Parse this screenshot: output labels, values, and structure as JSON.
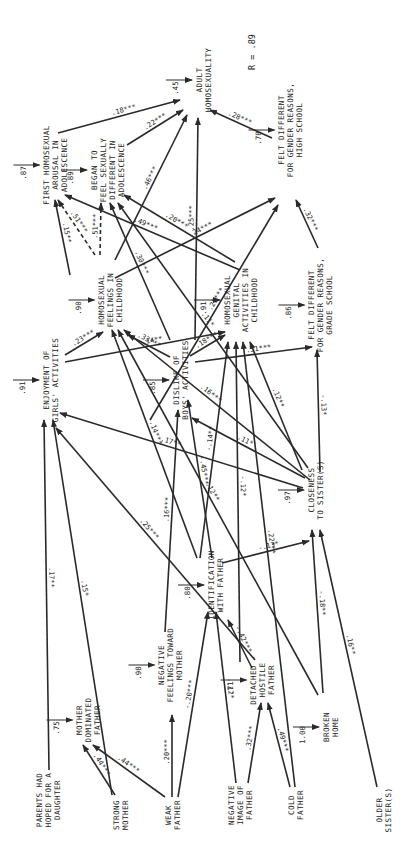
{
  "diagram": {
    "orientation": "rotated-90-ccw",
    "r_label": "R = .89",
    "nodes": [
      {
        "id": "parents_hoped_daughter",
        "lines": [
          "PARENTS HAD",
          "HOPED FOR A",
          "DAUGHTER"
        ],
        "x": 48,
        "y": 800,
        "residual": null
      },
      {
        "id": "strong_mother",
        "lines": [
          "STRONG",
          "MOTHER"
        ],
        "x": 120,
        "y": 815,
        "residual": null
      },
      {
        "id": "weak_father",
        "lines": [
          "WEAK",
          "FATHER"
        ],
        "x": 172,
        "y": 815,
        "residual": null
      },
      {
        "id": "negative_image_father",
        "lines": [
          "NEGATIVE",
          "IMAGE OF",
          "FATHER"
        ],
        "x": 240,
        "y": 805,
        "residual": null
      },
      {
        "id": "cold_father",
        "lines": [
          "COLD",
          "FATHER"
        ],
        "x": 295,
        "y": 805,
        "residual": null
      },
      {
        "id": "older_sisters",
        "lines": [
          "OLDER",
          "SISTER(S)"
        ],
        "x": 383,
        "y": 810,
        "residual": null
      },
      {
        "id": "mother_dominated_father",
        "lines": [
          "MOTHER",
          "DOMINATED",
          "FATHER"
        ],
        "x": 88,
        "y": 720,
        "residual": ".75"
      },
      {
        "id": "negative_feelings_mother",
        "lines": [
          "NEGATIVE",
          "FEELINGS TOWARD",
          "MOTHER"
        ],
        "x": 170,
        "y": 665,
        "residual": ".98"
      },
      {
        "id": "detached_hostile_father",
        "lines": [
          "DETACHED -",
          "HOSTILE",
          "FATHER"
        ],
        "x": 262,
        "y": 680,
        "residual": ".71"
      },
      {
        "id": "broken_home",
        "lines": [
          "BROKEN",
          "HOME"
        ],
        "x": 330,
        "y": 727,
        "residual": "1.00"
      },
      {
        "id": "identification_father",
        "lines": [
          "IDENTIFICATION",
          "WITH FATHER"
        ],
        "x": 215,
        "y": 585,
        "residual": ".80"
      },
      {
        "id": "closeness_sisters",
        "lines": [
          "CLOSENESS",
          "TO SISTER(S)"
        ],
        "x": 315,
        "y": 490,
        "residual": ".97"
      },
      {
        "id": "enjoyment_girls_activities",
        "lines": [
          "ENJOYMENT OF",
          "GIRLS' ACTIVITIES"
        ],
        "x": 50,
        "y": 380,
        "residual": ".91"
      },
      {
        "id": "dislike_boys_activities",
        "lines": [
          "DISLIKE OF",
          "BOYS' ACTIVITIES"
        ],
        "x": 180,
        "y": 380,
        "residual": ".85"
      },
      {
        "id": "homosexual_feelings_childhood",
        "lines": [
          "HOMOSEXUAL",
          "FEELINGS IN",
          "CHILDHOOD"
        ],
        "x": 110,
        "y": 300,
        "residual": ".90"
      },
      {
        "id": "homosexual_genital_activities_childhood",
        "lines": [
          "HOMOSEXUAL",
          "GENITAL",
          "ACTIVITIES IN",
          "CHILDHOOD"
        ],
        "x": 240,
        "y": 300,
        "residual": ".91"
      },
      {
        "id": "felt_different_grade_school",
        "lines": [
          "FELT DIFFERENT",
          "FOR GENDER REASONS,",
          "GRADE SCHOOL"
        ],
        "x": 320,
        "y": 305,
        "residual": ".86"
      },
      {
        "id": "first_homosexual_arousal",
        "lines": [
          "FIRST HOMOSEXUAL",
          "AROUSAL IN",
          "ADOLESCENCE"
        ],
        "x": 55,
        "y": 165,
        "residual": ".87"
      },
      {
        "id": "began_feel_sexually_different",
        "lines": [
          "BEGAN TO",
          "FEEL SEXUALLY",
          "DIFFERENT IN",
          "ADOLESCENCE"
        ],
        "x": 107,
        "y": 170,
        "residual": ".89"
      },
      {
        "id": "felt_different_high_school",
        "lines": [
          "FELT DIFFERENT",
          "FOR GENDER REASONS,",
          "HIGH SCHOOL"
        ],
        "x": 290,
        "y": 130,
        "residual": ".78"
      },
      {
        "id": "adult_homosexuality",
        "lines": [
          "ADULT",
          "HOMOSEXUALITY"
        ],
        "x": 203,
        "y": 80,
        "residual": ".45"
      }
    ],
    "edges": [
      {
        "from": "strong_mother",
        "to": "mother_dominated_father",
        "coef": ".44***",
        "x1": 115,
        "y1": 795,
        "x2": 83,
        "y2": 745
      },
      {
        "from": "weak_father",
        "to": "mother_dominated_father",
        "coef": ".44***",
        "x1": 165,
        "y1": 797,
        "x2": 93,
        "y2": 745
      },
      {
        "from": "weak_father",
        "to": "negative_feelings_mother",
        "coef": ".20***",
        "x1": 172,
        "y1": 797,
        "x2": 172,
        "y2": 715
      },
      {
        "from": "weak_father",
        "to": "identification_father",
        "coef": "-.20***",
        "x1": 178,
        "y1": 797,
        "x2": 208,
        "y2": 612
      },
      {
        "from": "negative_image_father",
        "to": "identification_father",
        "coef": "-.12*",
        "x1": 236,
        "y1": 783,
        "x2": 216,
        "y2": 612
      },
      {
        "from": "negative_image_father",
        "to": "detached_hostile_father",
        "coef": ".32***",
        "x1": 248,
        "y1": 783,
        "x2": 261,
        "y2": 703
      },
      {
        "from": "cold_father",
        "to": "detached_hostile_father",
        "coef": ".49***",
        "x1": 290,
        "y1": 787,
        "x2": 268,
        "y2": 703
      },
      {
        "from": "detached_hostile_father",
        "to": "identification_father",
        "coef": "-.42***",
        "x1": 252,
        "y1": 668,
        "x2": 228,
        "y2": 620
      },
      {
        "from": "identification_father",
        "to": "closeness_sisters",
        "coef": "-.13*",
        "x1": 222,
        "y1": 563,
        "x2": 309,
        "y2": 541
      },
      {
        "from": "broken_home",
        "to": "closeness_sisters",
        "coef": "-.18**",
        "x1": 323,
        "y1": 693,
        "x2": 312,
        "y2": 530
      },
      {
        "from": "older_sisters",
        "to": "closeness_sisters",
        "coef": ".16**",
        "x1": 377,
        "y1": 787,
        "x2": 320,
        "y2": 530
      },
      {
        "from": "identification_father",
        "to": "dislike_boys_activities",
        "coef": "-.45***",
        "x1": 212,
        "y1": 558,
        "x2": 188,
        "y2": 400
      },
      {
        "from": "parents_hoped_daughter",
        "to": "enjoyment_girls_activities",
        "coef": ".17**",
        "x1": 49,
        "y1": 770,
        "x2": 44,
        "y2": 420
      },
      {
        "from": "strong_mother",
        "to": "enjoyment_girls_activities",
        "coef": ".15*",
        "x1": 112,
        "y1": 795,
        "x2": 53,
        "y2": 420
      },
      {
        "from": "closeness_sisters",
        "to": "enjoyment_girls_activities",
        "coef": ".17**",
        "x1": 303,
        "y1": 488,
        "x2": 60,
        "y2": 413
      },
      {
        "from": "detached_hostile_father",
        "to": "enjoyment_girls_activities",
        "coef": ".25***",
        "x1": 255,
        "y1": 660,
        "x2": 56,
        "y2": 428
      },
      {
        "from": "negative_feelings_mother",
        "to": "dislike_boys_activities",
        "coef": ".16***",
        "x1": 165,
        "y1": 632,
        "x2": 178,
        "y2": 410
      },
      {
        "from": "closeness_sisters",
        "to": "dislike_boys_activities",
        "coef": ".11*",
        "x1": 305,
        "y1": 478,
        "x2": 192,
        "y2": 418
      },
      {
        "from": "enjoyment_girls_activities",
        "to": "homosexual_feelings_childhood",
        "coef": ".23***",
        "x1": 65,
        "y1": 355,
        "x2": 103,
        "y2": 332
      },
      {
        "from": "enjoyment_girls_activities",
        "to": "homosexual_genital_activities_childhood",
        "coef": ".14**",
        "x1": 65,
        "y1": 362,
        "x2": 225,
        "y2": 332
      },
      {
        "from": "dislike_boys_activities",
        "to": "homosexual_feelings_childhood",
        "coef": ".33***",
        "x1": 170,
        "y1": 357,
        "x2": 128,
        "y2": 335
      },
      {
        "from": "dislike_boys_activities",
        "to": "homosexual_genital_activities_childhood",
        "coef": ".18***",
        "x1": 190,
        "y1": 356,
        "x2": 225,
        "y2": 335
      },
      {
        "from": "dislike_boys_activities",
        "to": "felt_different_grade_school",
        "coef": ".51***",
        "x1": 195,
        "y1": 362,
        "x2": 312,
        "y2": 347
      },
      {
        "from": "identification_father",
        "to": "homosexual_feelings_childhood",
        "coef": "-.14***",
        "x1": 197,
        "y1": 558,
        "x2": 112,
        "y2": 330
      },
      {
        "from": "broken_home",
        "to": "homosexual_feelings_childhood",
        "coef": ".12**",
        "x1": 318,
        "y1": 695,
        "x2": 118,
        "y2": 330
      },
      {
        "from": "closeness_sisters",
        "to": "homosexual_feelings_childhood",
        "coef": ".16***",
        "x1": 310,
        "y1": 480,
        "x2": 124,
        "y2": 330
      },
      {
        "from": "identification_father",
        "to": "homosexual_genital_activities_childhood",
        "coef": "-.14**",
        "x1": 200,
        "y1": 558,
        "x2": 228,
        "y2": 342
      },
      {
        "from": "detached_hostile_father",
        "to": "homosexual_genital_activities_childhood",
        "coef": "-.12*",
        "x1": 240,
        "y1": 662,
        "x2": 236,
        "y2": 342
      },
      {
        "from": "cold_father",
        "to": "homosexual_genital_activities_childhood",
        "coef": ".22***",
        "x1": 295,
        "y1": 787,
        "x2": 243,
        "y2": 342
      },
      {
        "from": "closeness_sisters",
        "to": "homosexual_genital_activities_childhood",
        "coef": ".12**",
        "x1": 302,
        "y1": 470,
        "x2": 250,
        "y2": 342
      },
      {
        "from": "closeness_sisters",
        "to": "felt_different_grade_school",
        "coef": "-.13*",
        "x1": 320,
        "y1": 472,
        "x2": 317,
        "y2": 350
      },
      {
        "from": "homosexual_feelings_childhood",
        "to": "first_homosexual_arousal",
        "coef": ".15**",
        "x1": 70,
        "y1": 275,
        "x2": 55,
        "y2": 200
      },
      {
        "from": "homosexual_feelings_childhood",
        "to": "first_homosexual_arousal",
        "coef": ".51***",
        "dashed": true,
        "x1": 95,
        "y1": 255,
        "x2": 58,
        "y2": 200
      },
      {
        "from": "homosexual_feelings_childhood",
        "to": "began_feel_sexually_different",
        "coef": ".51***",
        "dashed": true,
        "x1": 100,
        "y1": 255,
        "x2": 101,
        "y2": 203
      },
      {
        "from": "homosexual_feelings_childhood",
        "to": "felt_different_high_school",
        "coef": ".24***",
        "x1": 115,
        "y1": 278,
        "x2": 275,
        "y2": 198
      },
      {
        "from": "dislike_boys_activities",
        "to": "began_feel_sexually_different",
        "coef": ".30***",
        "x1": 170,
        "y1": 340,
        "x2": 110,
        "y2": 203
      },
      {
        "from": "closeness_sisters",
        "to": "began_feel_sexually_different",
        "coef": ".11*",
        "x1": 308,
        "y1": 468,
        "x2": 118,
        "y2": 203
      },
      {
        "from": "homosexual_genital_activities_childhood",
        "to": "began_feel_sexually_different",
        "coef": ".20***",
        "x1": 235,
        "y1": 262,
        "x2": 124,
        "y2": 195
      },
      {
        "from": "homosexual_genital_activities_childhood",
        "to": "first_homosexual_arousal",
        "coef": ".49***",
        "x1": 240,
        "y1": 270,
        "x2": 65,
        "y2": 195
      },
      {
        "from": "felt_different_grade_school",
        "to": "felt_different_high_school",
        "coef": ".32***",
        "x1": 318,
        "y1": 248,
        "x2": 296,
        "y2": 200
      },
      {
        "from": "enjoyment_girls_activities",
        "to": "felt_different_high_school",
        "coef": ".25***",
        "x1": 150,
        "y1": 420,
        "x2": 278,
        "y2": 205
      },
      {
        "from": "first_homosexual_arousal",
        "to": "adult_homosexuality",
        "coef": ".18***",
        "x1": 58,
        "y1": 133,
        "x2": 180,
        "y2": 100
      },
      {
        "from": "began_feel_sexually_different",
        "to": "adult_homosexuality",
        "coef": ".22***",
        "x1": 127,
        "y1": 145,
        "x2": 183,
        "y2": 110
      },
      {
        "from": "homosexual_feelings_childhood",
        "to": "adult_homosexuality",
        "coef": ".46***",
        "x1": 115,
        "y1": 260,
        "x2": 187,
        "y2": 115
      },
      {
        "from": "dislike_boys_activities",
        "to": "adult_homosexuality",
        "coef": ".25***",
        "x1": 195,
        "y1": 340,
        "x2": 198,
        "y2": 118
      },
      {
        "from": "felt_different_high_school",
        "to": "adult_homosexuality",
        "coef": ".28***",
        "x1": 272,
        "y1": 138,
        "x2": 210,
        "y2": 110
      }
    ]
  }
}
